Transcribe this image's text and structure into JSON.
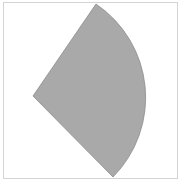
{
  "diagram": {
    "shape": "circular-sector",
    "fill": "#a9a9a9",
    "stroke": "#8c8c8c",
    "frame_color": "#d4d4d4",
    "apex": [
      33,
      96
    ],
    "start_point": [
      96,
      4
    ],
    "end_point": [
      113,
      177
    ],
    "radius": 113
  }
}
